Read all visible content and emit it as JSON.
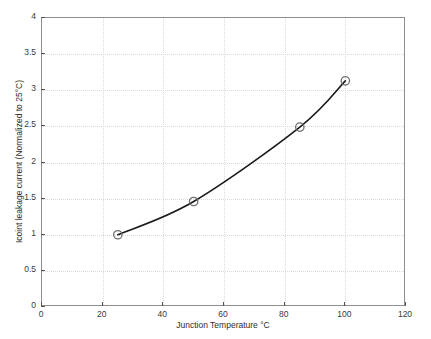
{
  "chart_data": {
    "type": "line",
    "title": "",
    "xlabel": "Junction Temperature °C",
    "ylabel": "Icoint leakage current (Normalized to 25°C)",
    "xlim": [
      0,
      120
    ],
    "ylim": [
      0,
      4
    ],
    "grid": true,
    "legend": null,
    "xticks": [
      0,
      20,
      40,
      60,
      80,
      100,
      120
    ],
    "xticklabels": [
      "0",
      "20",
      "40",
      "60",
      "80",
      "100",
      "120"
    ],
    "yticks": [
      0,
      0.5,
      1,
      1.5,
      2,
      2.5,
      3,
      3.5,
      4
    ],
    "yticklabels": [
      "0",
      "0.5",
      "1",
      "1.5",
      "2",
      "2.5",
      "3",
      "3.5",
      "4"
    ],
    "series": [
      {
        "name": "Icoint leakage current",
        "line_color": "#1a1a1a",
        "marker": "circle",
        "marker_edge_color": "#6e6e6e",
        "marker_face_color": "#ffffff",
        "x": [
          25,
          50,
          85,
          100
        ],
        "y": [
          1.0,
          1.46,
          2.49,
          3.13
        ]
      }
    ]
  },
  "figure": {
    "background_color": "#ffffff",
    "axes_color": "#8f8f8f",
    "grid_color": "#d9d9d9",
    "tick_label_color": "#3a3a3a"
  }
}
